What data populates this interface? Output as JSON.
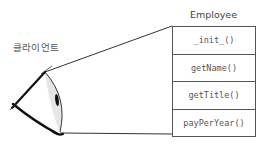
{
  "client": {
    "label": "클라이언트",
    "icon": "eye-icon"
  },
  "class_box": {
    "title": "Employee",
    "methods": [
      "_init_()",
      "getName()",
      "getTitle()",
      "payPerYear()"
    ]
  },
  "colors": {
    "line": "#333333",
    "box_border": "#555555",
    "text": "#555555",
    "cornea_shade": "#d9d9d9",
    "pupil": "#111111"
  }
}
